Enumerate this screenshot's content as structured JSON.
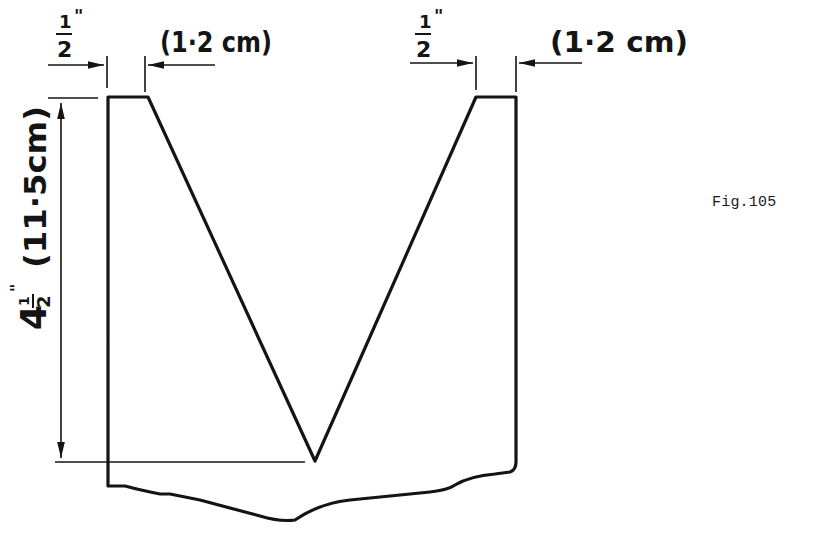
{
  "figure": {
    "caption": "Fig.105",
    "ink_color": "#141414",
    "background": "#ffffff"
  },
  "dimensions": {
    "top_left": {
      "fraction_numerator": "1",
      "fraction_denominator": "2",
      "unit_mark": "\"",
      "metric": "(1·2 cm)"
    },
    "top_right": {
      "fraction_numerator": "1",
      "fraction_denominator": "2",
      "unit_mark": "\"",
      "metric": "(1·2 cm)"
    },
    "height": {
      "whole": "4",
      "fraction_numerator": "1",
      "fraction_denominator": "2",
      "unit_mark": "\"",
      "metric": "(11·5cm)"
    }
  }
}
